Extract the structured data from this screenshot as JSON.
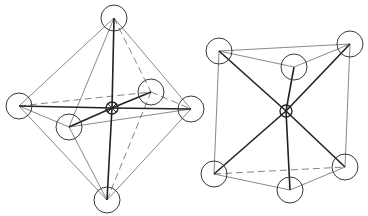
{
  "figure": {
    "colors": {
      "line": "#3a3a3a",
      "bond": "#222222",
      "background": "#ffffff"
    }
  },
  "octahedron": {
    "label": "octahedral coordination",
    "center": {
      "x": 112,
      "y": 108,
      "r": 6
    },
    "ligand_radius": 13,
    "vertices": [
      {
        "id": "top",
        "x": 114,
        "y": 18
      },
      {
        "id": "bottom",
        "x": 107,
        "y": 200
      },
      {
        "id": "left",
        "x": 19,
        "y": 106
      },
      {
        "id": "right",
        "x": 191,
        "y": 109
      },
      {
        "id": "front",
        "x": 69,
        "y": 127
      },
      {
        "id": "back",
        "x": 151,
        "y": 92
      }
    ],
    "solid_edges": [
      [
        "top",
        "left"
      ],
      [
        "top",
        "right"
      ],
      [
        "top",
        "front"
      ],
      [
        "bottom",
        "left"
      ],
      [
        "bottom",
        "right"
      ],
      [
        "bottom",
        "front"
      ],
      [
        "left",
        "front"
      ],
      [
        "front",
        "right"
      ]
    ],
    "dashed_edges": [
      [
        "top",
        "back"
      ],
      [
        "bottom",
        "back"
      ],
      [
        "left",
        "back"
      ],
      [
        "back",
        "right"
      ]
    ],
    "bonds": [
      "top",
      "bottom",
      "left",
      "right",
      "front",
      "back"
    ]
  },
  "trigonal_prism": {
    "label": "trigonal prismatic coordination",
    "center": {
      "x": 286,
      "y": 111,
      "r": 6
    },
    "ligand_radius": 13,
    "vertices": [
      {
        "id": "top-left",
        "x": 219,
        "y": 51
      },
      {
        "id": "top-right",
        "x": 350,
        "y": 44
      },
      {
        "id": "top-front",
        "x": 294,
        "y": 67
      },
      {
        "id": "bottom-left",
        "x": 214,
        "y": 174
      },
      {
        "id": "bottom-right",
        "x": 345,
        "y": 167
      },
      {
        "id": "bottom-front",
        "x": 290,
        "y": 190
      }
    ],
    "solid_edges": [
      [
        "top-left",
        "top-right"
      ],
      [
        "top-left",
        "top-front"
      ],
      [
        "top-front",
        "top-right"
      ],
      [
        "bottom-left",
        "bottom-front"
      ],
      [
        "bottom-front",
        "bottom-right"
      ],
      [
        "top-left",
        "bottom-left"
      ],
      [
        "top-right",
        "bottom-right"
      ]
    ],
    "dashed_edges": [
      [
        "bottom-left",
        "bottom-right"
      ]
    ],
    "bonds": [
      "top-left",
      "top-right",
      "top-front",
      "bottom-left",
      "bottom-right",
      "bottom-front"
    ]
  }
}
